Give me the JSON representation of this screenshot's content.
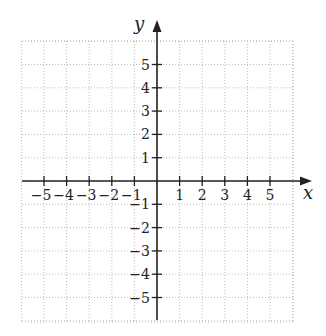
{
  "diagram": {
    "type": "coordinate-plane",
    "x_axis_label": "x",
    "y_axis_label": "y",
    "x_ticks": [
      "-5",
      "-4",
      "-3",
      "-2",
      "-1",
      "1",
      "2",
      "3",
      "4",
      "5"
    ],
    "y_ticks": [
      "5",
      "4",
      "3",
      "2",
      "1",
      "-1",
      "-2",
      "-3",
      "-4",
      "-5"
    ],
    "x_range": [
      -6,
      6
    ],
    "y_range": [
      -6,
      6
    ],
    "grid": "dotted",
    "colors": {
      "axis": "#222222",
      "grid": "#bbbbbb",
      "background": "#ffffff"
    }
  }
}
